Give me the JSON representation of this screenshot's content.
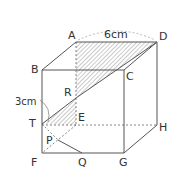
{
  "diagram": {
    "type": "cube cross-section",
    "vertices": {
      "A": "A",
      "B": "B",
      "C": "C",
      "D": "D",
      "E": "E",
      "F": "F",
      "G": "G",
      "H": "H"
    },
    "points": {
      "T": "T",
      "R": "R",
      "P": "P",
      "Q": "Q"
    },
    "labels": {
      "top_edge": "6cm",
      "bt_length": "3cm"
    },
    "colors": {
      "line": "#555555",
      "hatch": "#777777"
    }
  }
}
